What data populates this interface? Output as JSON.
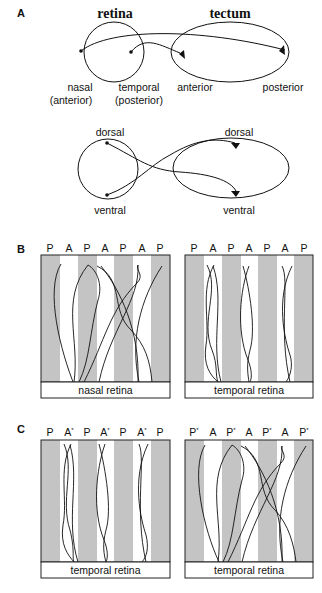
{
  "panel_a": {
    "letter": "A",
    "retina_title": "retina",
    "tectum_title": "tectum",
    "top_labels": {
      "nasal": "nasal",
      "nasal_sub": "(anterior)",
      "temporal": "temporal",
      "temporal_sub": "(posterior)",
      "anterior": "anterior",
      "posterior": "posterior"
    },
    "bottom_labels": {
      "retina_dorsal": "dorsal",
      "retina_ventral": "ventral",
      "tectum_dorsal": "dorsal",
      "tectum_ventral": "ventral"
    }
  },
  "panel_b": {
    "letter": "B",
    "left": {
      "columns": [
        "P",
        "A",
        "P",
        "A",
        "P",
        "A",
        "P"
      ],
      "caption": "nasal retina"
    },
    "right": {
      "columns": [
        "P",
        "A",
        "P",
        "A",
        "P",
        "A",
        "P"
      ],
      "caption": "temporal retina"
    }
  },
  "panel_c": {
    "letter": "C",
    "left": {
      "columns": [
        {
          "base": "P",
          "star": ""
        },
        {
          "base": "A",
          "star": "*"
        },
        {
          "base": "P",
          "star": ""
        },
        {
          "base": "A",
          "star": "*"
        },
        {
          "base": "P",
          "star": ""
        },
        {
          "base": "A",
          "star": "*"
        },
        {
          "base": "P",
          "star": ""
        }
      ],
      "caption": "temporal retina"
    },
    "right": {
      "columns": [
        {
          "base": "P",
          "star": "*"
        },
        {
          "base": "A",
          "star": ""
        },
        {
          "base": "P",
          "star": "*"
        },
        {
          "base": "A",
          "star": ""
        },
        {
          "base": "P",
          "star": "*"
        },
        {
          "base": "A",
          "star": ""
        },
        {
          "base": "P",
          "star": "*"
        }
      ],
      "caption": "temporal retina"
    }
  },
  "colors": {
    "stripe": "#c4c4c4",
    "line": "#111111",
    "background": "#ffffff"
  }
}
